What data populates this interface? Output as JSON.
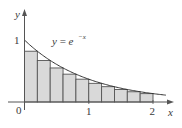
{
  "diagram": {
    "type": "riemann_sum",
    "function_label": "y = e^{-x}",
    "function_label_parts": {
      "lhs": "y",
      "eq": " = ",
      "base": "e",
      "exp": "−x"
    },
    "axes": {
      "x_label": "x",
      "y_label": "y",
      "origin_label": "0",
      "x_ticks": [
        "1",
        "2"
      ],
      "y_ticks": [
        "1"
      ]
    },
    "colors": {
      "rect_fill": "#d9d9d9",
      "rect_stroke": "#555555",
      "curve": "#333333",
      "axis": "#555555"
    }
  },
  "chart_data": {
    "type": "area",
    "title": "",
    "function": "y = e^(-x)",
    "xlabel": "x",
    "ylabel": "y",
    "xlim": [
      0,
      2.2
    ],
    "ylim": [
      0,
      1
    ],
    "x_ticks": [
      0,
      1,
      2
    ],
    "y_ticks": [
      1
    ],
    "method": "right-endpoint Riemann sum",
    "interval": [
      0,
      2
    ],
    "n_rectangles": 10,
    "rect_width": 0.2,
    "rect_left_edges": [
      0,
      0.2,
      0.4,
      0.6,
      0.8,
      1.0,
      1.2,
      1.4,
      1.6,
      1.8
    ],
    "rect_heights": [
      0.819,
      0.67,
      0.549,
      0.449,
      0.368,
      0.301,
      0.247,
      0.202,
      0.165,
      0.135
    ],
    "grid": false
  }
}
